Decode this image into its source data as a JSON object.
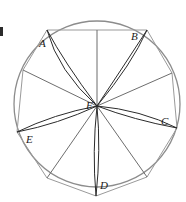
{
  "figure": {
    "type": "geometry-diagram",
    "canvas": {
      "width": 186,
      "height": 202,
      "background": "#ffffff"
    },
    "circle": {
      "cx": 97,
      "cy": 104,
      "r": 83,
      "stroke": "#8c8c8c",
      "stroke_width": 1.3
    },
    "center_point": {
      "id": "F",
      "x": 97,
      "y": 106
    },
    "colors": {
      "circle": "#8c8c8c",
      "thin_chord": "#9a9a9a",
      "thin_ray": "#6d6d6d",
      "spindle": "#2b2b2b",
      "label": "#1a1a1a"
    },
    "vertices": [
      {
        "id": "A",
        "x": 47,
        "y": 30,
        "labeled": true,
        "label_x": 39,
        "label_y": 38
      },
      {
        "id": "B",
        "x": 147,
        "y": 30,
        "labeled": true,
        "label_x": 131,
        "label_y": 31
      },
      {
        "id": "C",
        "x": 177,
        "y": 128,
        "labeled": true,
        "label_x": 161,
        "label_y": 116
      },
      {
        "id": "D",
        "x": 96,
        "y": 196,
        "labeled": true,
        "label_x": 100,
        "label_y": 180
      },
      {
        "id": "E",
        "x": 17,
        "y": 132,
        "labeled": true,
        "label_x": 26,
        "label_y": 134
      },
      {
        "id": "P1",
        "x": 23,
        "y": 70,
        "labeled": false,
        "label_x": 0,
        "label_y": 0
      },
      {
        "id": "P2",
        "x": 172,
        "y": 73,
        "labeled": false,
        "label_x": 0,
        "label_y": 0
      },
      {
        "id": "P3",
        "x": 47,
        "y": 178,
        "labeled": false,
        "label_x": 0,
        "label_y": 0
      },
      {
        "id": "P4",
        "x": 147,
        "y": 177,
        "labeled": false,
        "label_x": 0,
        "label_y": 0
      }
    ],
    "spindle_rays": [
      {
        "from": "F",
        "to": "A"
      },
      {
        "from": "F",
        "to": "B"
      },
      {
        "from": "F",
        "to": "C"
      },
      {
        "from": "F",
        "to": "D"
      },
      {
        "from": "F",
        "to": "E"
      }
    ],
    "thin_rays": [
      {
        "from": "F",
        "to": "P1"
      },
      {
        "from": "F",
        "to": "P2"
      },
      {
        "from": "F",
        "to": "P3"
      },
      {
        "from": "F",
        "to": "P4"
      },
      {
        "from": "F",
        "to": "TOP"
      }
    ],
    "chords": [
      {
        "from": "A",
        "to": "B"
      },
      {
        "from": "B",
        "to": "P2"
      },
      {
        "from": "P2",
        "to": "C"
      },
      {
        "from": "C",
        "to": "P4"
      },
      {
        "from": "P4",
        "to": "D"
      },
      {
        "from": "D",
        "to": "P3"
      },
      {
        "from": "P3",
        "to": "E"
      },
      {
        "from": "E",
        "to": "P1"
      },
      {
        "from": "P1",
        "to": "A"
      }
    ],
    "labels": {
      "A": "A",
      "B": "B",
      "C": "C",
      "D": "D",
      "E": "E",
      "F": "F",
      "F_x": 86,
      "F_y": 100
    },
    "edge_mark": {
      "present": true,
      "note": "cropped glyph at left image edge"
    }
  }
}
